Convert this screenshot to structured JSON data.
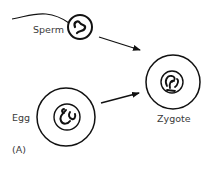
{
  "diagram": {
    "panel_label": "(A)",
    "nodes": [
      {
        "id": "sperm",
        "label": "Sperm"
      },
      {
        "id": "egg",
        "label": "Egg"
      },
      {
        "id": "zygote",
        "label": "Zygote"
      }
    ],
    "edges": [
      {
        "from": "sperm",
        "to": "zygote"
      },
      {
        "from": "egg",
        "to": "zygote"
      }
    ],
    "colors": {
      "stroke": "#111111",
      "text": "#3a3a3a",
      "background": "#ffffff"
    }
  }
}
